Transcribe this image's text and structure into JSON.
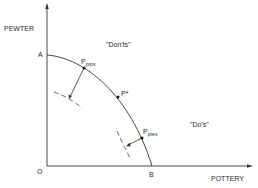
{
  "diagram": {
    "axes": {
      "y_label": "PEWTER",
      "x_label": "POTTERY",
      "origin_label": "O"
    },
    "points": {
      "a": "A",
      "b": "B",
      "p_pros_main": "P",
      "p_pros_sub": "pros",
      "p_star": "P*",
      "p_pres_main": "P",
      "p_pres_sub": "pres"
    },
    "regions": {
      "donts": "\"Don'ts\"",
      "dos": "\"Do's\""
    },
    "colors": {
      "line": "#333333",
      "background": "#ffffff"
    }
  }
}
